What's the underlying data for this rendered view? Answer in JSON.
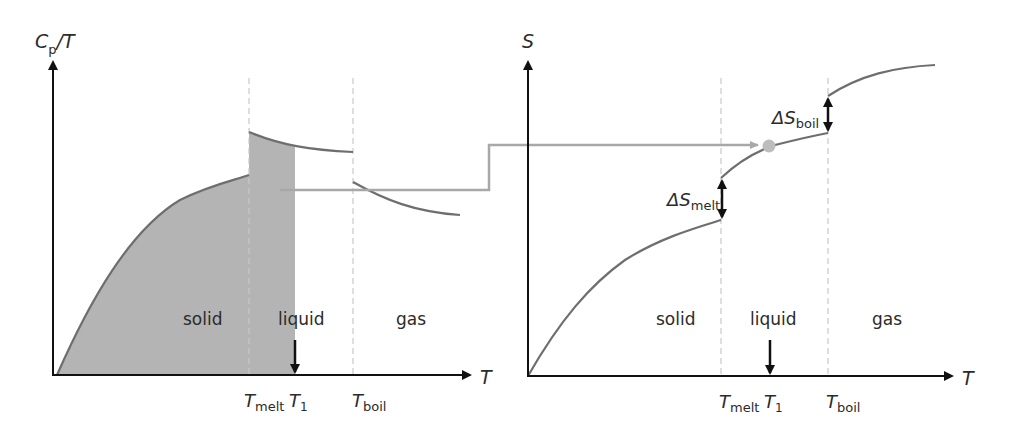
{
  "left_chart": {
    "y_axis_label": {
      "main": "C",
      "sub": "p",
      "rest": "/T"
    },
    "x_axis_label": "T",
    "region_labels": [
      "solid",
      "liquid",
      "gas"
    ],
    "ticks": [
      {
        "main": "T",
        "sub": "melt"
      },
      {
        "main": "T",
        "sub": "1"
      },
      {
        "main": "T",
        "sub": "boil"
      }
    ],
    "shaded_area_description": "Integral of Cp/T from 0 to T1"
  },
  "right_chart": {
    "y_axis_label": "S",
    "x_axis_label": "T",
    "region_labels": [
      "solid",
      "liquid",
      "gas"
    ],
    "ticks": [
      {
        "main": "T",
        "sub": "melt"
      },
      {
        "main": "T",
        "sub": "1"
      },
      {
        "main": "T",
        "sub": "boil"
      }
    ],
    "annotations": [
      {
        "main": "ΔS",
        "sub": "melt"
      },
      {
        "main": "ΔS",
        "sub": "boil"
      }
    ]
  },
  "colors": {
    "axis": "#111111",
    "curve": "#6e6e6e",
    "shade": "#b4b4b4",
    "dashed": "#c8c8c8",
    "connector": "#a8a8a8",
    "marker": "#bdbdbd"
  }
}
